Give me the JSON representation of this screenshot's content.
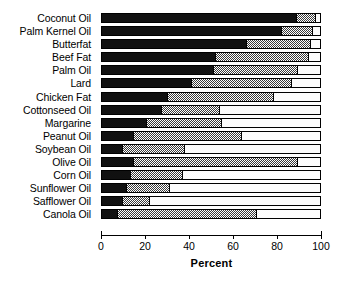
{
  "chart_data": {
    "type": "bar",
    "subtype": "stacked-horizontal-100pct",
    "title": "",
    "xlabel": "Percent",
    "ylabel": "",
    "xlim": [
      0,
      100
    ],
    "xticks": [
      0,
      20,
      40,
      60,
      80,
      100
    ],
    "xtick_labels": [
      "0",
      "20",
      "40",
      "60",
      "80",
      "100"
    ],
    "grid": false,
    "legend": false,
    "orientation": "horizontal",
    "categories": [
      "Coconut Oil",
      "Palm Kernel Oil",
      "Butterfat",
      "Beef Fat",
      "Palm Oil",
      "Lard",
      "Chicken Fat",
      "Cottonseed Oil",
      "Margarine",
      "Peanut Oil",
      "Soybean Oil",
      "Olive Oil",
      "Corn Oil",
      "Sunflower Oil",
      "Safflower Oil",
      "Canola Oil"
    ],
    "series": [
      {
        "name": "saturated",
        "fill": "black",
        "values": [
          89,
          82,
          66,
          52,
          51,
          41,
          30,
          27,
          20,
          14,
          9,
          14,
          13,
          11,
          9,
          7
        ]
      },
      {
        "name": "monounsaturated",
        "fill": "gray-checker",
        "values": [
          9,
          15,
          30,
          43,
          39,
          46,
          49,
          27,
          35,
          50,
          29,
          76,
          24,
          20,
          13,
          64
        ]
      },
      {
        "name": "polyunsaturated",
        "fill": "white",
        "values": [
          2,
          3,
          4,
          5,
          10,
          13,
          21,
          46,
          45,
          36,
          62,
          10,
          63,
          69,
          78,
          29
        ]
      }
    ],
    "colors": {
      "saturated": "#111111",
      "monounsaturated": "#3a3a3a",
      "polyunsaturated": "#fcfcfc",
      "axis": "#000000",
      "background": "#ffffff"
    }
  }
}
